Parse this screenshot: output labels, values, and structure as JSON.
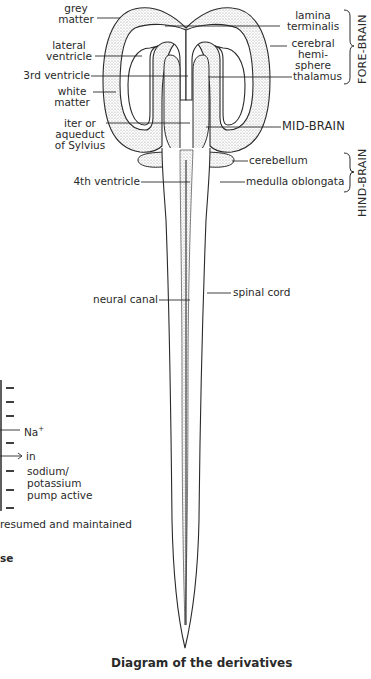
{
  "diagram": {
    "caption": "Diagram of the derivatives",
    "left_labels": {
      "grey_matter": [
        "grey",
        "matter"
      ],
      "lateral_ventricle": [
        "lateral",
        "ventricle"
      ],
      "third_ventricle": "3rd ventricle",
      "white_matter": [
        "white",
        "matter"
      ],
      "iter": [
        "iter or",
        "aqueduct",
        "of Sylvius"
      ],
      "fourth_ventricle": "4th ventricle",
      "neural_canal": "neural canal"
    },
    "right_labels": {
      "lamina_terminalis": [
        "lamina",
        "terminalis"
      ],
      "cerebral_hemisphere": [
        "cerebral",
        "hemi-",
        "sphere"
      ],
      "thalamus": "thalamus",
      "mid_brain": "MID-BRAIN",
      "cerebellum": "cerebellum",
      "medulla_oblongata": "medulla oblongata",
      "spinal_cord": "spinal cord"
    },
    "brackets": {
      "fore_brain": "FORE-BRAIN",
      "hind_brain": "HIND-BRAIN"
    }
  },
  "fragment": {
    "na": "Na",
    "na_sup": "+",
    "in": "in",
    "pump": [
      "sodium/",
      "potassium",
      "pump active"
    ],
    "resumed": "resumed and maintained",
    "se": "se"
  },
  "colors": {
    "ink": "#2a2a2a",
    "stipple": "#8a8a8a",
    "background": "#ffffff"
  }
}
